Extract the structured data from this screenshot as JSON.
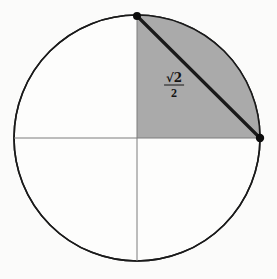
{
  "figure": {
    "background_color": "#fbfbfa",
    "circle": {
      "center_x": 137,
      "center_y": 138,
      "radius": 123,
      "stroke_color": "#1a1a1a",
      "stroke_width": 1.6,
      "fill_color": "#fdfdfc"
    },
    "axes": {
      "stroke_color": "#7d7d7d",
      "stroke_width": 1,
      "horizontal": {
        "x1": 14,
        "y1": 138,
        "x2": 260,
        "y2": 138
      },
      "vertical": {
        "x1": 137,
        "y1": 15,
        "x2": 137,
        "y2": 261
      }
    },
    "shaded_sector": {
      "quadrant": "first",
      "fill_color": "#aaaaaa",
      "start_angle_deg": 0,
      "end_angle_deg": 90
    },
    "chord": {
      "from_label": "top-point",
      "to_label": "right-point",
      "x1": 137,
      "y1": 16,
      "x2": 260,
      "y2": 138,
      "stroke_color": "#1a1a1a",
      "stroke_width": 3.2
    },
    "points": [
      {
        "name": "top-point",
        "x": 137,
        "y": 16,
        "radius": 4,
        "color": "#0d0d0d"
      },
      {
        "name": "right-point",
        "x": 260,
        "y": 138,
        "radius": 4.2,
        "color": "#0d0d0d"
      }
    ],
    "labels": [
      {
        "name": "chord-length-label",
        "numerator": "√2",
        "denominator": "2",
        "x": 174,
        "y": 85,
        "color": "#141414"
      }
    ]
  }
}
